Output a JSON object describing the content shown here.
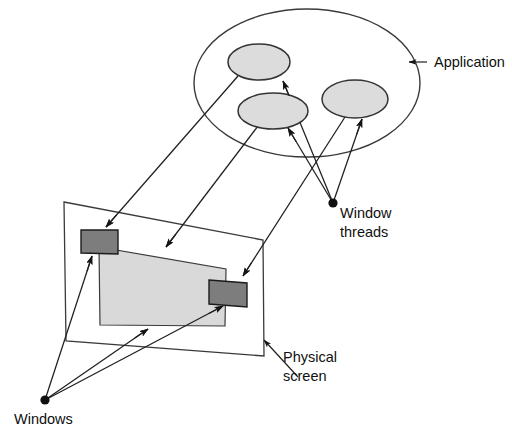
{
  "figure": {
    "background_color": "#ffffff",
    "line_color": "#1f1f1f",
    "thread_fill_color": "#dcdcdc",
    "screen_fill_color": "#d9d9d9",
    "window_fill_color": "#7d7d7d"
  },
  "labels": {
    "application": "Application",
    "window_threads_line1": "Window",
    "window_threads_line2": "threads",
    "physical_screen_line1": "Physical",
    "physical_screen_line2": "screen",
    "windows": "Windows"
  },
  "shapes": {
    "application_ellipse": {
      "name": "Application",
      "cx": 307,
      "cy": 83,
      "rx": 113,
      "ry": 74
    },
    "thread_ellipses": [
      {
        "name": "window thread 1",
        "cx": 259,
        "cy": 62,
        "rx": 31,
        "ry": 18
      },
      {
        "name": "window thread 2",
        "cx": 273,
        "cy": 111,
        "rx": 35,
        "ry": 18
      },
      {
        "name": "window thread 3",
        "cx": 355,
        "cy": 99,
        "rx": 33,
        "ry": 19
      }
    ],
    "physical_screen": {
      "name": "Physical screen",
      "corners": [
        [
          64,
          202
        ],
        [
          263,
          240
        ],
        [
          264,
          356
        ],
        [
          66,
          341
        ]
      ]
    },
    "screen_content": {
      "name": "screen content area",
      "corners": [
        [
          99,
          247
        ],
        [
          226,
          269
        ],
        [
          225,
          326
        ],
        [
          100,
          325
        ]
      ]
    },
    "windows": [
      {
        "name": "window 1",
        "corners": [
          [
            81,
            230
          ],
          [
            118,
            230
          ],
          [
            118,
            254
          ],
          [
            81,
            253
          ]
        ]
      },
      {
        "name": "window 2",
        "corners": [
          [
            209,
            280
          ],
          [
            247,
            283
          ],
          [
            247,
            307
          ],
          [
            209,
            304
          ]
        ]
      }
    ],
    "nodes": [
      {
        "name": "window-threads-node",
        "cx": 333,
        "cy": 203,
        "r": 4.6
      },
      {
        "name": "windows-node",
        "cx": 45,
        "cy": 400,
        "r": 4.6
      }
    ]
  },
  "connectors": [
    {
      "name": "thread1-to-window1",
      "from": [
        238,
        76
      ],
      "to": [
        106,
        227
      ],
      "arrow_at": "to"
    },
    {
      "name": "thread2-to-screen",
      "from": [
        258,
        126
      ],
      "to": [
        166,
        247
      ],
      "arrow_at": "to"
    },
    {
      "name": "thread3-to-window2",
      "from": [
        345,
        117
      ],
      "to": [
        243,
        276
      ],
      "arrow_at": "to"
    },
    {
      "name": "node-to-thread1",
      "from": [
        333,
        203
      ],
      "to": [
        283,
        81
      ],
      "arrow_at": "to"
    },
    {
      "name": "node-to-thread2",
      "from": [
        333,
        203
      ],
      "to": [
        288,
        128
      ],
      "arrow_at": "to"
    },
    {
      "name": "node-to-thread3",
      "from": [
        333,
        203
      ],
      "to": [
        362,
        119
      ],
      "arrow_at": "to"
    },
    {
      "name": "windows-node-to-window1",
      "from": [
        45,
        400
      ],
      "to": [
        92,
        256
      ],
      "arrow_at": "to"
    },
    {
      "name": "windows-node-to-screen",
      "from": [
        45,
        400
      ],
      "to": [
        148,
        329
      ],
      "arrow_at": "to"
    },
    {
      "name": "windows-node-to-window2",
      "from": [
        45,
        400
      ],
      "to": [
        223,
        306
      ],
      "arrow_at": "to"
    }
  ],
  "leaders": [
    {
      "name": "application-leader",
      "from": [
        427,
        62
      ],
      "to": [
        409,
        62
      ],
      "arrow_at": "to"
    },
    {
      "name": "physical-screen-leader",
      "from": [
        298,
        377
      ],
      "to": [
        264,
        340
      ],
      "arrow_at": "to"
    }
  ]
}
